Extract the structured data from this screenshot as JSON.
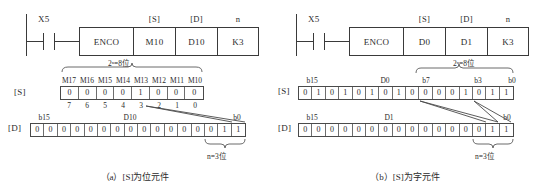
{
  "figure": {
    "panels": [
      {
        "id": "a",
        "caption": "（a）[S]为位元件",
        "ladder": {
          "contact_label": "X5",
          "instruction": "ENCO",
          "operands": [
            {
              "tag": "[S]",
              "value": "M10"
            },
            {
              "tag": "[D]",
              "value": "D10"
            },
            {
              "tag": "n",
              "value": "K3"
            }
          ]
        },
        "source": {
          "row_tag": "[S]",
          "span_label": "2ⁿ=8位",
          "bit_names": [
            "M17",
            "M16",
            "M15",
            "M14",
            "M13",
            "M12",
            "M11",
            "M10"
          ],
          "bits": [
            0,
            0,
            0,
            0,
            1,
            0,
            0,
            0
          ],
          "index_labels": [
            7,
            6,
            5,
            4,
            3,
            2,
            1,
            0
          ]
        },
        "dest": {
          "row_tag": "[D]",
          "name": "D10",
          "left_label": "b15",
          "right_label": "b0",
          "bits": [
            0,
            0,
            0,
            0,
            0,
            0,
            0,
            0,
            0,
            0,
            0,
            0,
            0,
            0,
            1,
            1
          ],
          "bracket_label": "n=3位"
        }
      },
      {
        "id": "b",
        "caption": "（b）[S]为字元件",
        "ladder": {
          "contact_label": "X5",
          "instruction": "ENCO",
          "operands": [
            {
              "tag": "[S]",
              "value": "D0"
            },
            {
              "tag": "[D]",
              "value": "D1"
            },
            {
              "tag": "n",
              "value": "K3"
            }
          ]
        },
        "source": {
          "row_tag": "[S]",
          "name": "D0",
          "left_label": "b15",
          "mid_label": "b7",
          "mid2_label": "b3",
          "right_label": "b0",
          "span_label": "2ⁿ=8位",
          "bits": [
            0,
            1,
            0,
            1,
            0,
            1,
            0,
            1,
            0,
            0,
            0,
            0,
            1,
            0,
            1,
            1
          ]
        },
        "dest": {
          "row_tag": "[D]",
          "name": "D1",
          "left_label": "b15",
          "right_label": "b0",
          "bits": [
            0,
            0,
            0,
            0,
            0,
            0,
            0,
            0,
            0,
            0,
            0,
            0,
            0,
            0,
            1,
            1
          ],
          "bracket_label": "n=3位"
        }
      }
    ]
  }
}
